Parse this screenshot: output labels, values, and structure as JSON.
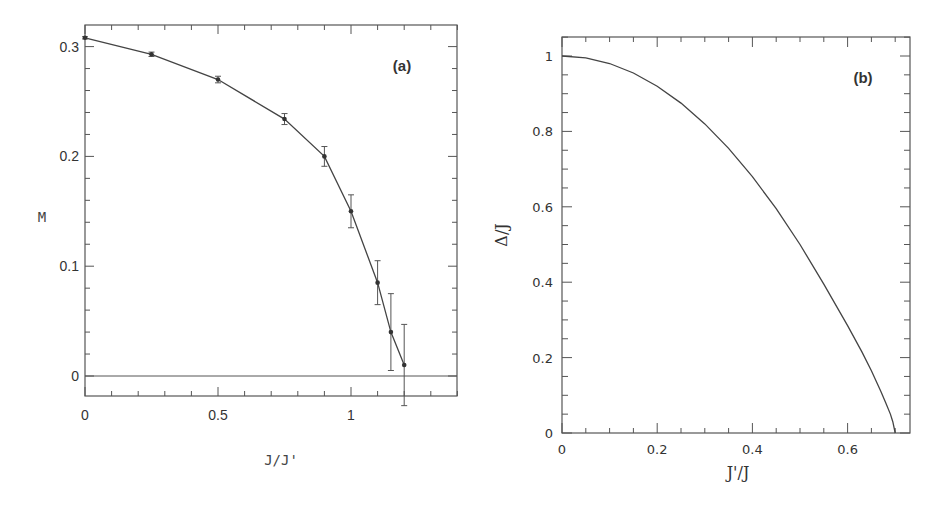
{
  "chart_data": [
    {
      "id": "a",
      "type": "line",
      "panel_label": "(a)",
      "title": "",
      "xlabel": "J/J'",
      "ylabel": "M",
      "xlim": [
        0,
        1.4
      ],
      "ylim": [
        -0.05,
        0.32
      ],
      "xticks": [
        0,
        0.5,
        1
      ],
      "xtick_labels": [
        "0",
        "0.5",
        "1"
      ],
      "yticks": [
        0,
        0.1,
        0.2,
        0.3
      ],
      "ytick_labels": [
        "0",
        "0.1",
        "0.2",
        "0.3"
      ],
      "grid": false,
      "reference_line": {
        "y": 0
      },
      "series": [
        {
          "name": "M",
          "x": [
            0,
            0.25,
            0.5,
            0.75,
            0.9,
            1.0,
            1.1,
            1.15,
            1.2
          ],
          "y": [
            0.308,
            0.293,
            0.27,
            0.234,
            0.2,
            0.15,
            0.085,
            0.04,
            0.01
          ],
          "yerr": [
            0.001,
            0.002,
            0.003,
            0.005,
            0.009,
            0.015,
            0.02,
            0.035,
            0.037
          ],
          "markers": true,
          "error_bars": true
        }
      ]
    },
    {
      "id": "b",
      "type": "line",
      "panel_label": "(b)",
      "title": "",
      "xlabel": "J'/J",
      "ylabel": "Δ/J",
      "xlim": [
        0,
        0.73
      ],
      "ylim": [
        0,
        1.05
      ],
      "xticks": [
        0,
        0.2,
        0.4,
        0.6
      ],
      "xtick_labels": [
        "0",
        "0.2",
        "0.4",
        "0.6"
      ],
      "yticks": [
        0,
        0.2,
        0.4,
        0.6,
        0.8,
        1
      ],
      "ytick_labels": [
        "0",
        "0.2",
        "0.4",
        "0.6",
        "0.8",
        "1"
      ],
      "grid": false,
      "series": [
        {
          "name": "Δ/J",
          "x": [
            0,
            0.05,
            0.1,
            0.15,
            0.2,
            0.25,
            0.3,
            0.35,
            0.4,
            0.45,
            0.5,
            0.55,
            0.6,
            0.63,
            0.65,
            0.67,
            0.68,
            0.69,
            0.695,
            0.7
          ],
          "y": [
            1.0,
            0.995,
            0.98,
            0.955,
            0.92,
            0.875,
            0.82,
            0.755,
            0.68,
            0.595,
            0.5,
            0.395,
            0.285,
            0.215,
            0.165,
            0.11,
            0.08,
            0.05,
            0.03,
            0.0
          ],
          "markers": false
        }
      ]
    }
  ]
}
